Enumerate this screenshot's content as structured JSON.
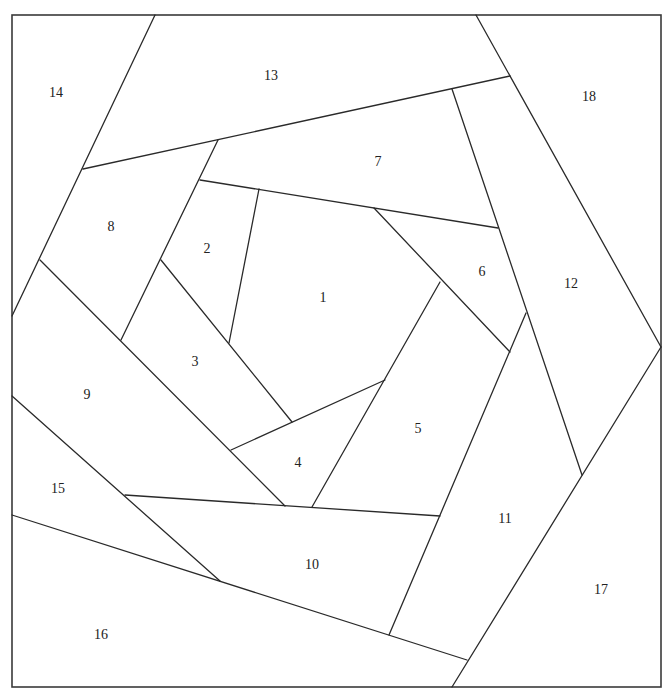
{
  "diagram": {
    "type": "foundation-pieced quilt block pattern",
    "frame": {
      "x1": 12,
      "y1": 15,
      "x2": 661,
      "y2": 687
    },
    "line_color": "#2a2a2a",
    "background": "#ffffff",
    "seams": [
      [
        [
          155,
          15
        ],
        [
          12,
          316
        ]
      ],
      [
        [
          476,
          15
        ],
        [
          661,
          347
        ]
      ],
      [
        [
          661,
          347
        ],
        [
          452,
          687
        ]
      ],
      [
        [
          83,
          169
        ],
        [
          510,
          76
        ]
      ],
      [
        [
          218,
          140
        ],
        [
          121,
          340
        ]
      ],
      [
        [
          200,
          180
        ],
        [
          498,
          228
        ]
      ],
      [
        [
          259,
          189
        ],
        [
          229,
          343
        ]
      ],
      [
        [
          161,
          260
        ],
        [
          292,
          422
        ]
      ],
      [
        [
          40,
          260
        ],
        [
          285,
          506
        ]
      ],
      [
        [
          452,
          89
        ],
        [
          582,
          475
        ]
      ],
      [
        [
          374,
          208
        ],
        [
          510,
          352
        ]
      ],
      [
        [
          440,
          282
        ],
        [
          312,
          507
        ]
      ],
      [
        [
          231,
          450
        ],
        [
          385,
          380
        ]
      ],
      [
        [
          526,
          313
        ],
        [
          389,
          635
        ]
      ],
      [
        [
          125,
          495
        ],
        [
          440,
          516
        ]
      ],
      [
        [
          12,
          396
        ],
        [
          220,
          581
        ]
      ],
      [
        [
          12,
          515
        ],
        [
          467,
          660
        ]
      ]
    ],
    "pieces": [
      {
        "label": "1",
        "x": 323,
        "y": 299
      },
      {
        "label": "2",
        "x": 207,
        "y": 250
      },
      {
        "label": "3",
        "x": 195,
        "y": 363
      },
      {
        "label": "4",
        "x": 298,
        "y": 464
      },
      {
        "label": "5",
        "x": 418,
        "y": 430
      },
      {
        "label": "6",
        "x": 482,
        "y": 273
      },
      {
        "label": "7",
        "x": 378,
        "y": 163
      },
      {
        "label": "8",
        "x": 111,
        "y": 228
      },
      {
        "label": "9",
        "x": 87,
        "y": 396
      },
      {
        "label": "10",
        "x": 312,
        "y": 566
      },
      {
        "label": "11",
        "x": 505,
        "y": 520
      },
      {
        "label": "12",
        "x": 571,
        "y": 285
      },
      {
        "label": "13",
        "x": 271,
        "y": 77
      },
      {
        "label": "14",
        "x": 56,
        "y": 94
      },
      {
        "label": "15",
        "x": 58,
        "y": 490
      },
      {
        "label": "16",
        "x": 101,
        "y": 636
      },
      {
        "label": "17",
        "x": 601,
        "y": 591
      },
      {
        "label": "18",
        "x": 589,
        "y": 98
      }
    ]
  }
}
